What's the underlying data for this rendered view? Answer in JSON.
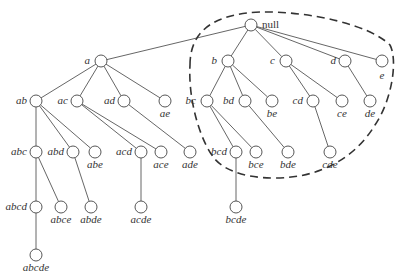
{
  "diagram": {
    "node_radius": 6,
    "colors": {
      "edge": "#555555",
      "node_stroke": "#444444",
      "node_fill": "#ffffff",
      "text": "#333333",
      "boundary": "#333333"
    },
    "nodes": [
      {
        "id": "null",
        "label": "null",
        "x": 251,
        "y": 25,
        "lx": 262,
        "ly": 28,
        "anchor": "start",
        "root": true
      },
      {
        "id": "a",
        "label": "a",
        "x": 101,
        "y": 61,
        "lx": 90,
        "ly": 64,
        "anchor": "end"
      },
      {
        "id": "b",
        "label": "b",
        "x": 228,
        "y": 61,
        "lx": 217,
        "ly": 64,
        "anchor": "end"
      },
      {
        "id": "c",
        "label": "c",
        "x": 286,
        "y": 61,
        "lx": 275,
        "ly": 64,
        "anchor": "end"
      },
      {
        "id": "d",
        "label": "d",
        "x": 345,
        "y": 61,
        "lx": 336,
        "ly": 64,
        "anchor": "end"
      },
      {
        "id": "e",
        "label": "e",
        "x": 382,
        "y": 61,
        "lx": 382,
        "ly": 79,
        "anchor": "middle"
      },
      {
        "id": "ab",
        "label": "ab",
        "x": 36,
        "y": 101,
        "lx": 27,
        "ly": 104,
        "anchor": "end"
      },
      {
        "id": "ac",
        "label": "ac",
        "x": 77,
        "y": 101,
        "lx": 68,
        "ly": 104,
        "anchor": "end"
      },
      {
        "id": "ad",
        "label": "ad",
        "x": 124,
        "y": 101,
        "lx": 115,
        "ly": 104,
        "anchor": "end"
      },
      {
        "id": "ae",
        "label": "ae",
        "x": 165,
        "y": 101,
        "lx": 165,
        "ly": 117,
        "anchor": "middle"
      },
      {
        "id": "bc",
        "label": "bc",
        "x": 207,
        "y": 101,
        "lx": 196,
        "ly": 104,
        "anchor": "end"
      },
      {
        "id": "bd",
        "label": "bd",
        "x": 245,
        "y": 101,
        "lx": 234,
        "ly": 104,
        "anchor": "end"
      },
      {
        "id": "be",
        "label": "be",
        "x": 272,
        "y": 101,
        "lx": 272,
        "ly": 117,
        "anchor": "middle"
      },
      {
        "id": "cd",
        "label": "cd",
        "x": 313,
        "y": 101,
        "lx": 303,
        "ly": 104,
        "anchor": "end"
      },
      {
        "id": "ce",
        "label": "ce",
        "x": 342,
        "y": 101,
        "lx": 342,
        "ly": 117,
        "anchor": "middle"
      },
      {
        "id": "de",
        "label": "de",
        "x": 370,
        "y": 101,
        "lx": 370,
        "ly": 117,
        "anchor": "middle"
      },
      {
        "id": "abc",
        "label": "abc",
        "x": 36,
        "y": 152,
        "lx": 27,
        "ly": 155,
        "anchor": "end"
      },
      {
        "id": "abd",
        "label": "abd",
        "x": 73,
        "y": 152,
        "lx": 64,
        "ly": 155,
        "anchor": "end"
      },
      {
        "id": "abe",
        "label": "abe",
        "x": 95,
        "y": 152,
        "lx": 95,
        "ly": 168,
        "anchor": "middle"
      },
      {
        "id": "acd",
        "label": "acd",
        "x": 141,
        "y": 152,
        "lx": 132,
        "ly": 155,
        "anchor": "end"
      },
      {
        "id": "ace",
        "label": "ace",
        "x": 161,
        "y": 152,
        "lx": 161,
        "ly": 168,
        "anchor": "middle"
      },
      {
        "id": "ade",
        "label": "ade",
        "x": 190,
        "y": 152,
        "lx": 190,
        "ly": 168,
        "anchor": "middle"
      },
      {
        "id": "bcd",
        "label": "bcd",
        "x": 236,
        "y": 152,
        "lx": 227,
        "ly": 155,
        "anchor": "end"
      },
      {
        "id": "bce",
        "label": "bce",
        "x": 256,
        "y": 152,
        "lx": 256,
        "ly": 168,
        "anchor": "middle"
      },
      {
        "id": "bde",
        "label": "bde",
        "x": 288,
        "y": 152,
        "lx": 288,
        "ly": 168,
        "anchor": "middle"
      },
      {
        "id": "cde",
        "label": "cde",
        "x": 330,
        "y": 152,
        "lx": 330,
        "ly": 168,
        "anchor": "middle"
      },
      {
        "id": "abcd",
        "label": "abcd",
        "x": 36,
        "y": 207,
        "lx": 27,
        "ly": 210,
        "anchor": "end"
      },
      {
        "id": "abce",
        "label": "abce",
        "x": 61,
        "y": 207,
        "lx": 61,
        "ly": 223,
        "anchor": "middle"
      },
      {
        "id": "abde",
        "label": "abde",
        "x": 91,
        "y": 207,
        "lx": 91,
        "ly": 223,
        "anchor": "middle"
      },
      {
        "id": "acde",
        "label": "acde",
        "x": 141,
        "y": 207,
        "lx": 141,
        "ly": 223,
        "anchor": "middle"
      },
      {
        "id": "bcde",
        "label": "bcde",
        "x": 236,
        "y": 207,
        "lx": 236,
        "ly": 223,
        "anchor": "middle"
      },
      {
        "id": "abcde",
        "label": "abcde",
        "x": 36,
        "y": 255,
        "lx": 36,
        "ly": 271,
        "anchor": "middle"
      }
    ],
    "edges": [
      [
        "null",
        "a"
      ],
      [
        "null",
        "b"
      ],
      [
        "null",
        "c"
      ],
      [
        "null",
        "d"
      ],
      [
        "null",
        "e"
      ],
      [
        "a",
        "ab"
      ],
      [
        "a",
        "ac"
      ],
      [
        "a",
        "ad"
      ],
      [
        "a",
        "ae"
      ],
      [
        "b",
        "bc"
      ],
      [
        "b",
        "bd"
      ],
      [
        "b",
        "be"
      ],
      [
        "c",
        "cd"
      ],
      [
        "c",
        "ce"
      ],
      [
        "d",
        "de"
      ],
      [
        "ab",
        "abc"
      ],
      [
        "ab",
        "abd"
      ],
      [
        "ab",
        "abe"
      ],
      [
        "ac",
        "acd"
      ],
      [
        "ac",
        "ace"
      ],
      [
        "ad",
        "ade"
      ],
      [
        "bc",
        "bcd"
      ],
      [
        "bc",
        "bce"
      ],
      [
        "bd",
        "bde"
      ],
      [
        "cd",
        "cde"
      ],
      [
        "abc",
        "abcd"
      ],
      [
        "abc",
        "abce"
      ],
      [
        "abd",
        "abde"
      ],
      [
        "acd",
        "acde"
      ],
      [
        "bcd",
        "bcde"
      ],
      [
        "abcd",
        "abcde"
      ]
    ],
    "boundary": {
      "style": "dashed",
      "encloses": [
        "null",
        "b",
        "c",
        "d",
        "e",
        "bc",
        "bd",
        "be",
        "cd",
        "ce",
        "de",
        "bcd",
        "bce",
        "bde",
        "cde"
      ],
      "path": "M 190 65 C 190 30, 215 14, 260 12 C 310 11, 370 25, 390 45 C 398 60, 392 100, 375 125 C 355 158, 320 178, 275 178 C 240 178, 222 168, 214 158 C 200 140, 188 100, 190 65 Z"
    }
  }
}
